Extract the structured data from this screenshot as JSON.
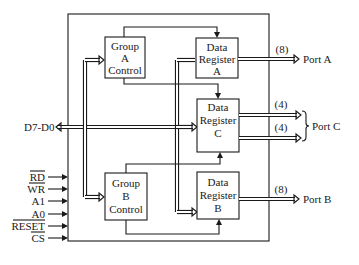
{
  "diagram": {
    "blocks": {
      "group_a": [
        "Group",
        "A",
        "Control"
      ],
      "group_b": [
        "Group",
        "B",
        "Control"
      ],
      "reg_a": [
        "Data",
        "Register",
        "A"
      ],
      "reg_b": [
        "Data",
        "Register",
        "B"
      ],
      "reg_c": [
        "Data",
        "Register",
        "C"
      ]
    },
    "data_bus_label": "D7-D0",
    "control_inputs": [
      "RD",
      "WR",
      "A1",
      "A0",
      "RESET",
      "CS"
    ],
    "outputs": {
      "port_a": {
        "label": "Port A",
        "width": "(8)"
      },
      "port_b": {
        "label": "Port B",
        "width": "(8)"
      },
      "port_c": {
        "label": "Port C",
        "width_upper": "(4)",
        "width_lower": "(4)"
      }
    }
  }
}
